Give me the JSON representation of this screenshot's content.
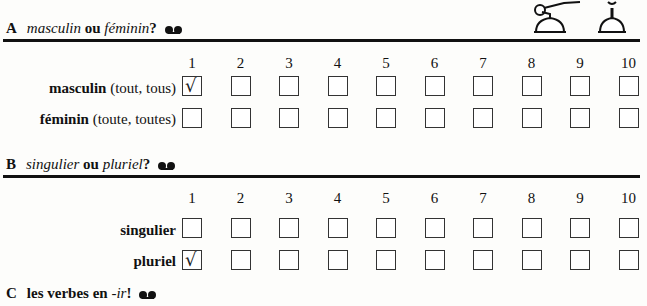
{
  "sections": [
    {
      "letter": "A",
      "title_parts": [
        {
          "text": "masculin",
          "style": "italic"
        },
        {
          "text": " ou ",
          "style": "bold"
        },
        {
          "text": "féminin",
          "style": "italic"
        },
        {
          "text": "?",
          "style": "bold"
        }
      ],
      "icon": "cassette-tape-icon",
      "columns": [
        "1",
        "2",
        "3",
        "4",
        "5",
        "6",
        "7",
        "8",
        "9",
        "10"
      ],
      "rows": [
        {
          "label_bold": "masculin",
          "label_rest": " (tout, tous)",
          "checked": [
            true,
            false,
            false,
            false,
            false,
            false,
            false,
            false,
            false,
            false
          ]
        },
        {
          "label_bold": "féminin",
          "label_rest": " (toute, toutes)",
          "checked": [
            false,
            false,
            false,
            false,
            false,
            false,
            false,
            false,
            false,
            false
          ]
        }
      ]
    },
    {
      "letter": "B",
      "title_parts": [
        {
          "text": "singulier",
          "style": "italic"
        },
        {
          "text": " ou ",
          "style": "bold"
        },
        {
          "text": "pluriel",
          "style": "italic"
        },
        {
          "text": "?",
          "style": "bold"
        }
      ],
      "icon": "cassette-tape-icon",
      "columns": [
        "1",
        "2",
        "3",
        "4",
        "5",
        "6",
        "7",
        "8",
        "9",
        "10"
      ],
      "rows": [
        {
          "label_bold": "singulier",
          "label_rest": "",
          "checked": [
            false,
            false,
            false,
            false,
            false,
            false,
            false,
            false,
            false,
            false
          ]
        },
        {
          "label_bold": "pluriel",
          "label_rest": "",
          "checked": [
            true,
            false,
            false,
            false,
            false,
            false,
            false,
            false,
            false,
            false
          ]
        }
      ]
    },
    {
      "letter": "C",
      "title_parts": [
        {
          "text": "les verbes en ",
          "style": "bold"
        },
        {
          "text": "-ir",
          "style": "italic"
        },
        {
          "text": "!",
          "style": "bold"
        }
      ],
      "icon": "cassette-tape-icon"
    }
  ],
  "check_glyph": "√"
}
